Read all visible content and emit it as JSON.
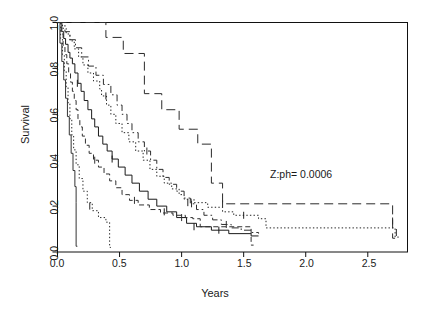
{
  "figure": {
    "type": "kaplan-meier-survival-plot",
    "background": "#ffffff",
    "frame_color": "#000000"
  },
  "axes": {
    "x_title": "Years",
    "y_title": "Survival",
    "x_ticks": [
      "0.0",
      "0.5",
      "1.0",
      "1.5",
      "2.0",
      "2.5"
    ],
    "y_ticks": [
      "0.0",
      "0.2",
      "0.4",
      "0.6",
      "0.8",
      "1.0"
    ]
  },
  "annotation": {
    "text": "Z:ph= 0.0006",
    "x_value": 1.35,
    "y_value": 0.335
  },
  "chart_data": {
    "type": "line",
    "subtype": "step-kaplan-meier",
    "title": "",
    "xlabel": "Years",
    "ylabel": "Survival",
    "xlim": [
      0.0,
      2.82
    ],
    "ylim": [
      0.0,
      1.0
    ],
    "x_ticks": [
      0.0,
      0.5,
      1.0,
      1.5,
      2.0,
      2.5
    ],
    "y_ticks": [
      0.0,
      0.2,
      0.4,
      0.6,
      0.8,
      1.0
    ],
    "grid": false,
    "legend": "none",
    "annotations": [
      {
        "text": "Z:ph= 0.0006",
        "x": 1.35,
        "y": 0.335
      }
    ],
    "series": [
      {
        "name": "group-1",
        "linestyle": "solid",
        "color": "#1a1a1a",
        "points": [
          [
            0.0,
            1.0
          ],
          [
            0.035,
            0.96
          ],
          [
            0.05,
            0.93
          ],
          [
            0.065,
            0.905
          ],
          [
            0.085,
            0.87
          ],
          [
            0.1,
            0.845
          ],
          [
            0.12,
            0.82
          ],
          [
            0.14,
            0.78
          ],
          [
            0.165,
            0.735
          ],
          [
            0.19,
            0.7
          ],
          [
            0.215,
            0.66
          ],
          [
            0.245,
            0.62
          ],
          [
            0.275,
            0.58
          ],
          [
            0.3,
            0.545
          ],
          [
            0.33,
            0.505
          ],
          [
            0.365,
            0.47
          ],
          [
            0.4,
            0.44
          ],
          [
            0.44,
            0.405
          ],
          [
            0.49,
            0.37
          ],
          [
            0.545,
            0.335
          ],
          [
            0.6,
            0.3
          ],
          [
            0.66,
            0.265
          ],
          [
            0.73,
            0.23
          ],
          [
            0.8,
            0.2
          ],
          [
            0.88,
            0.175
          ],
          [
            0.96,
            0.15
          ],
          [
            1.04,
            0.125
          ],
          [
            1.12,
            0.11
          ],
          [
            1.24,
            0.095
          ],
          [
            1.38,
            0.08
          ],
          [
            1.56,
            0.07
          ],
          [
            1.62,
            0.07
          ]
        ],
        "censor_marks": [
          [
            0.16,
            0.735
          ],
          [
            0.44,
            0.405
          ],
          [
            0.86,
            0.175
          ],
          [
            1.1,
            0.11
          ],
          [
            1.3,
            0.095
          ]
        ]
      },
      {
        "name": "group-2",
        "linestyle": "dashed-long",
        "color": "#2b2b2b",
        "points": [
          [
            0.0,
            1.0
          ],
          [
            0.39,
            1.0
          ],
          [
            0.39,
            0.935
          ],
          [
            0.53,
            0.935
          ],
          [
            0.53,
            0.865
          ],
          [
            0.7,
            0.865
          ],
          [
            0.7,
            0.69
          ],
          [
            0.84,
            0.69
          ],
          [
            0.84,
            0.62
          ],
          [
            0.98,
            0.62
          ],
          [
            0.98,
            0.535
          ],
          [
            1.13,
            0.535
          ],
          [
            1.13,
            0.47
          ],
          [
            1.24,
            0.47
          ],
          [
            1.24,
            0.3
          ],
          [
            1.33,
            0.3
          ],
          [
            1.33,
            0.21
          ],
          [
            2.7,
            0.21
          ],
          [
            2.7,
            0.06
          ],
          [
            2.72,
            0.06
          ]
        ],
        "censor_marks": [
          [
            1.33,
            0.21
          ],
          [
            2.7,
            0.135
          ]
        ]
      },
      {
        "name": "group-3",
        "linestyle": "dotted",
        "color": "#222222",
        "points": [
          [
            0.0,
            1.0
          ],
          [
            0.04,
            0.975
          ],
          [
            0.07,
            0.95
          ],
          [
            0.1,
            0.92
          ],
          [
            0.135,
            0.885
          ],
          [
            0.17,
            0.85
          ],
          [
            0.205,
            0.815
          ],
          [
            0.245,
            0.78
          ],
          [
            0.29,
            0.745
          ],
          [
            0.34,
            0.71
          ],
          [
            0.355,
            0.68
          ],
          [
            0.395,
            0.68
          ],
          [
            0.395,
            0.64
          ],
          [
            0.43,
            0.6
          ],
          [
            0.47,
            0.56
          ],
          [
            0.52,
            0.52
          ],
          [
            0.575,
            0.48
          ],
          [
            0.63,
            0.44
          ],
          [
            0.69,
            0.4
          ],
          [
            0.745,
            0.36
          ],
          [
            0.8,
            0.33
          ],
          [
            0.86,
            0.3
          ],
          [
            0.92,
            0.275
          ],
          [
            0.98,
            0.25
          ],
          [
            1.02,
            0.23
          ],
          [
            1.1,
            0.215
          ],
          [
            1.21,
            0.195
          ],
          [
            1.33,
            0.175
          ],
          [
            1.42,
            0.16
          ],
          [
            1.62,
            0.145
          ],
          [
            1.68,
            0.105
          ],
          [
            2.72,
            0.105
          ],
          [
            2.72,
            0.065
          ],
          [
            2.76,
            0.065
          ]
        ],
        "censor_marks": [
          [
            0.39,
            0.68
          ],
          [
            1.05,
            0.215
          ],
          [
            1.5,
            0.16
          ],
          [
            2.73,
            0.085
          ]
        ]
      },
      {
        "name": "group-4",
        "linestyle": "dash-dot",
        "color": "#2e2e2e",
        "points": [
          [
            0.0,
            1.0
          ],
          [
            0.06,
            0.96
          ],
          [
            0.1,
            0.925
          ],
          [
            0.145,
            0.89
          ],
          [
            0.195,
            0.85
          ],
          [
            0.25,
            0.81
          ],
          [
            0.31,
            0.77
          ],
          [
            0.37,
            0.73
          ],
          [
            0.43,
            0.685
          ],
          [
            0.48,
            0.64
          ],
          [
            0.52,
            0.6
          ],
          [
            0.56,
            0.56
          ],
          [
            0.6,
            0.52
          ],
          [
            0.65,
            0.48
          ],
          [
            0.7,
            0.44
          ],
          [
            0.75,
            0.4
          ],
          [
            0.8,
            0.36
          ],
          [
            0.85,
            0.325
          ],
          [
            0.9,
            0.295
          ],
          [
            0.96,
            0.265
          ],
          [
            1.02,
            0.235
          ],
          [
            1.07,
            0.21
          ],
          [
            1.12,
            0.185
          ],
          [
            1.18,
            0.16
          ],
          [
            1.25,
            0.14
          ],
          [
            1.32,
            0.12
          ],
          [
            1.4,
            0.105
          ],
          [
            1.48,
            0.095
          ],
          [
            1.56,
            0.085
          ],
          [
            1.62,
            0.08
          ]
        ],
        "censor_marks": [
          [
            0.72,
            0.44
          ],
          [
            1.08,
            0.21
          ],
          [
            1.36,
            0.12
          ]
        ]
      },
      {
        "name": "group-5",
        "linestyle": "dashed-short",
        "color": "#303030",
        "points": [
          [
            0.0,
            1.0
          ],
          [
            0.03,
            0.95
          ],
          [
            0.045,
            0.9
          ],
          [
            0.06,
            0.86
          ],
          [
            0.075,
            0.82
          ],
          [
            0.09,
            0.78
          ],
          [
            0.105,
            0.74
          ],
          [
            0.12,
            0.7
          ],
          [
            0.135,
            0.66
          ],
          [
            0.15,
            0.62
          ],
          [
            0.165,
            0.58
          ],
          [
            0.18,
            0.545
          ],
          [
            0.2,
            0.505
          ],
          [
            0.225,
            0.465
          ],
          [
            0.255,
            0.43
          ],
          [
            0.29,
            0.4
          ],
          [
            0.33,
            0.37
          ],
          [
            0.375,
            0.34
          ],
          [
            0.42,
            0.31
          ],
          [
            0.47,
            0.28
          ],
          [
            0.52,
            0.25
          ],
          [
            0.58,
            0.225
          ],
          [
            0.65,
            0.205
          ],
          [
            0.74,
            0.185
          ],
          [
            0.83,
            0.17
          ],
          [
            0.93,
            0.16
          ],
          [
            1.03,
            0.15
          ],
          [
            1.09,
            0.145
          ],
          [
            1.15,
            0.11
          ],
          [
            1.56,
            0.11
          ],
          [
            1.56,
            0.03
          ],
          [
            1.58,
            0.03
          ]
        ],
        "censor_marks": [
          [
            0.3,
            0.4
          ],
          [
            0.62,
            0.225
          ],
          [
            1.0,
            0.15
          ]
        ]
      },
      {
        "name": "group-6",
        "linestyle": "dotted-steep",
        "color": "#2a2a2a",
        "points": [
          [
            0.0,
            1.0
          ],
          [
            0.025,
            0.93
          ],
          [
            0.04,
            0.86
          ],
          [
            0.055,
            0.79
          ],
          [
            0.07,
            0.72
          ],
          [
            0.085,
            0.65
          ],
          [
            0.1,
            0.58
          ],
          [
            0.115,
            0.51
          ],
          [
            0.13,
            0.445
          ],
          [
            0.15,
            0.38
          ],
          [
            0.175,
            0.32
          ],
          [
            0.205,
            0.265
          ],
          [
            0.24,
            0.215
          ],
          [
            0.28,
            0.18
          ],
          [
            0.33,
            0.15
          ],
          [
            0.39,
            0.13
          ],
          [
            0.42,
            0.055
          ],
          [
            0.42,
            0.02
          ],
          [
            0.43,
            0.02
          ]
        ],
        "censor_marks": [
          [
            0.26,
            0.2
          ]
        ]
      },
      {
        "name": "group-7",
        "linestyle": "solid-steep",
        "color": "#343434",
        "points": [
          [
            0.0,
            1.0
          ],
          [
            0.02,
            0.91
          ],
          [
            0.035,
            0.83
          ],
          [
            0.05,
            0.75
          ],
          [
            0.065,
            0.67
          ],
          [
            0.08,
            0.59
          ],
          [
            0.095,
            0.51
          ],
          [
            0.11,
            0.43
          ],
          [
            0.125,
            0.355
          ],
          [
            0.14,
            0.285
          ],
          [
            0.15,
            0.215
          ],
          [
            0.15,
            0.025
          ],
          [
            0.16,
            0.025
          ]
        ],
        "censor_marks": []
      }
    ]
  }
}
